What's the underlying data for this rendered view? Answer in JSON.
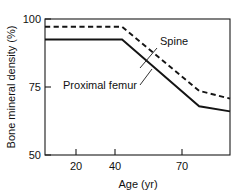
{
  "chart_data": {
    "type": "line",
    "title": "",
    "subtitle": "",
    "xlabel": "Age (yr)",
    "ylabel": "Bone mineral density (%)",
    "xlim": [
      10,
      82
    ],
    "ylim": [
      50,
      103
    ],
    "xticks": [
      20,
      40,
      70
    ],
    "xticklabels": [
      "20",
      "40",
      "70"
    ],
    "yticks": [
      50,
      75,
      100
    ],
    "yticklabels": [
      "50",
      "75",
      "100"
    ],
    "grid": false,
    "legend_position": "inline-annotations",
    "series": [
      {
        "name": "Spine",
        "style": "dashed",
        "x": [
          10,
          40,
          70,
          82
        ],
        "values": [
          100,
          100,
          75,
          72
        ]
      },
      {
        "name": "Proximal femur",
        "style": "solid",
        "x": [
          10,
          40,
          70,
          82
        ],
        "values": [
          95,
          95,
          69,
          67
        ]
      }
    ],
    "annotations": [
      {
        "text": "Spine",
        "x": 57,
        "y": 91
      },
      {
        "text": "Proximal femur",
        "x": 30,
        "y": 80
      }
    ]
  },
  "labels": {
    "y_axis_title": "Bone mineral density (%)",
    "x_axis_title": "Age (yr)",
    "y_tick_100": "100",
    "y_tick_75": "75",
    "y_tick_50": "50",
    "x_tick_20": "20",
    "x_tick_40": "40",
    "x_tick_70": "70",
    "series_spine": "Spine",
    "series_femur": "Proximal femur"
  },
  "colors": {
    "line": "#141414",
    "axis": "#1a1a1a",
    "text": "#111111",
    "background": "#ffffff"
  }
}
